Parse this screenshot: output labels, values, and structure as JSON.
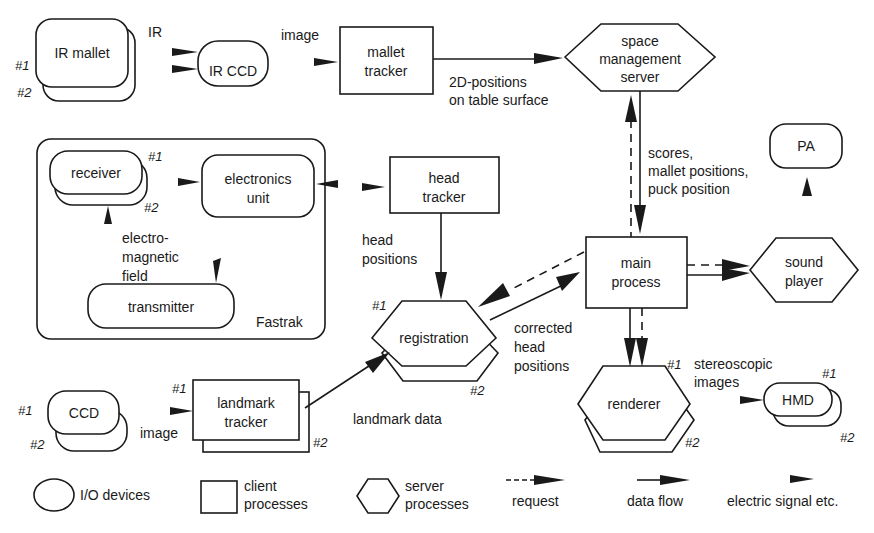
{
  "nodes": {
    "ir_mallet": {
      "label": "IR mallet",
      "n1": "#1",
      "n2": "#2"
    },
    "ir_ccd": {
      "label": "IR CCD"
    },
    "mallet_tracker": {
      "line1": "mallet",
      "line2": "tracker"
    },
    "space_server": {
      "line1": "space",
      "line2": "management",
      "line3": "server"
    },
    "receiver": {
      "label": "receiver",
      "n1": "#1",
      "n2": "#2"
    },
    "electronics_unit": {
      "line1": "electronics",
      "line2": "unit"
    },
    "transmitter": {
      "label": "transmitter"
    },
    "fastrak": {
      "label": "Fastrak"
    },
    "head_tracker": {
      "line1": "head",
      "line2": "tracker"
    },
    "pa": {
      "label": "PA"
    },
    "main_process": {
      "line1": "main",
      "line2": "process"
    },
    "sound_player": {
      "line1": "sound",
      "line2": "player"
    },
    "registration": {
      "label": "registration",
      "n1": "#1",
      "n2": "#2"
    },
    "renderer": {
      "label": "renderer",
      "n1": "#1",
      "n2": "#2"
    },
    "hmd": {
      "label": "HMD",
      "n1": "#1",
      "n2": "#2"
    },
    "ccd": {
      "label": "CCD",
      "n1": "#1",
      "n2": "#2"
    },
    "landmark_tracker": {
      "line1": "landmark",
      "line2": "tracker",
      "n1": "#1",
      "n2": "#2"
    }
  },
  "edge_labels": {
    "ir": "IR",
    "image_top": "image",
    "pos2d_1": "2D-positions",
    "pos2d_2": "on table surface",
    "em_1": "electro-",
    "em_2": "magnetic",
    "em_3": "field",
    "head_pos_1": "head",
    "head_pos_2": "positions",
    "scores_1": "scores,",
    "scores_2": "mallet positions,",
    "scores_3": "puck position",
    "corr_1": "corrected",
    "corr_2": "head",
    "corr_3": "positions",
    "landmark_data": "landmark data",
    "image_bottom": "image",
    "stereo_1": "stereoscopic",
    "stereo_2": "images"
  },
  "legend": {
    "io": "I/O devices",
    "client_1": "client",
    "client_2": "processes",
    "server_1": "server",
    "server_2": "processes",
    "request": "request",
    "data_flow": "data flow",
    "electric": "electric signal etc."
  }
}
